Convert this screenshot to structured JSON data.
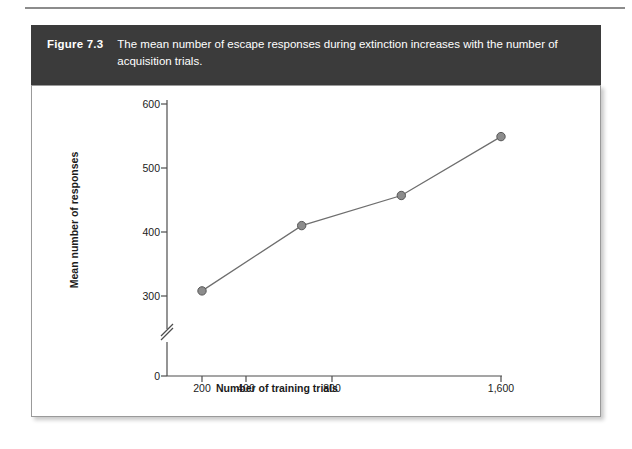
{
  "figure": {
    "number": "Figure 7.3",
    "caption": "The mean number of escape responses during extinction increases with the number of acquisition trials."
  },
  "chart_data": {
    "type": "line",
    "title": "",
    "xlabel": "Number of training trials",
    "ylabel": "Mean number of responses",
    "x_tick_labels": [
      "200",
      "400",
      "800",
      "1,600"
    ],
    "x_values": [
      200,
      400,
      800,
      1600
    ],
    "x_scale": "log2",
    "y_tick_labels": [
      "0",
      "300",
      "400",
      "500",
      "600"
    ],
    "y_ticks": [
      0,
      300,
      400,
      500,
      600
    ],
    "ylim": [
      0,
      600
    ],
    "y_axis_break": true,
    "y_axis_break_between": [
      0,
      300
    ],
    "grid": false,
    "legend": false,
    "marker": "circle",
    "series": [
      {
        "name": "Mean number of escape responses",
        "values": [
          308,
          410,
          457,
          549
        ]
      }
    ]
  },
  "colors": {
    "caption_bar": "#3b3b3b",
    "caption_text": "#ffffff",
    "panel_background": "#ffffff",
    "panel_border": "#9a9a9a",
    "axis": "#4d4d4d",
    "line": "#6e6e6e",
    "marker_fill": "#8c8c8c",
    "marker_stroke": "#565656",
    "text": "#1b1b1b"
  }
}
